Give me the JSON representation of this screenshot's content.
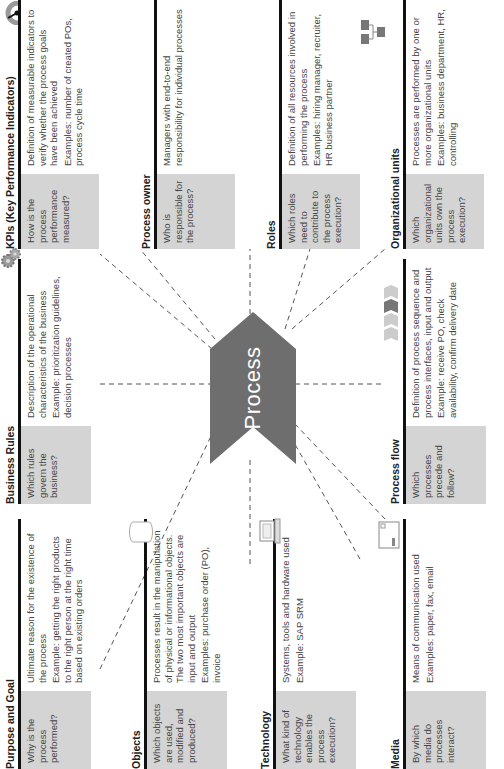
{
  "center": {
    "label": "Process",
    "color": "#6e6e6e"
  },
  "colors": {
    "question_bg": "#d4d4d4",
    "bar": "#111111",
    "link": "#555555"
  },
  "cards": {
    "purpose": {
      "title": "Purpose and Goal",
      "question": "Why is the process performed?",
      "desc": [
        "Ultimate reason for the existence of the process",
        "Example: getting the right products to the right person at the right time based on existing orders"
      ]
    },
    "objects": {
      "title": "Objects",
      "question": "Which objects are used, modified and produced?",
      "desc": [
        "Processes result in the manipulation of physical or informational objects. The two most important objects are input and output",
        "Examples: purchase order (PO), invoice"
      ],
      "icon": "cylinder-icon"
    },
    "technology": {
      "title": "Technology",
      "question": "What kind of technology enables the process execution?",
      "desc": [
        "Systems, tools and hardware used",
        "Example: SAP SRM"
      ],
      "icon": "computer-icon"
    },
    "media": {
      "title": "Media",
      "question": "By which media do processes interact?",
      "desc": [
        "Means of communication used",
        "Examples: paper, fax, email"
      ],
      "icon": "document-icon"
    },
    "business_rules": {
      "title": "Business Rules",
      "question": "Which rules govern the business?",
      "desc": [
        "Description of the operational characteristics of the business",
        "Example: prioritization guidelines, decision processes"
      ],
      "icon": "gears-icon"
    },
    "process_flow": {
      "title": "Process flow",
      "question": "Which processes precede and follow?",
      "desc": [
        "Definition of process sequence and process interfaces, input and output",
        "Example: receive PO, check availability, confirm delivery date"
      ],
      "icon": "process-steps-icon"
    },
    "kpis": {
      "title": "KPIs (Key Performance Indicators)",
      "question": "How is the process performance measured?",
      "desc": [
        "Definition of measurable indicators to verify whether the process goals have been achieved",
        "Examples: number of created POs, process cycle time"
      ],
      "icon": "gauge-icon"
    },
    "owner": {
      "title": "Process owner",
      "question": "Who is responsible for the process?",
      "desc": [
        "Managers with end-to-end responsibility for individual processes"
      ]
    },
    "roles": {
      "title": "Roles",
      "question": "Which roles need to contribute to the process execution?",
      "desc": [
        "Definition of all resources involved in performing the process",
        "Examples: hiring manager, recruiter, HR business partner"
      ]
    },
    "org_units": {
      "title": "Organizational units",
      "question": "Which organizational units own the process execution?",
      "desc": [
        "Processes are performed by one or more organizational units",
        "Examples: business department, HR, controlling"
      ],
      "icon": "org-chart-icon"
    }
  }
}
